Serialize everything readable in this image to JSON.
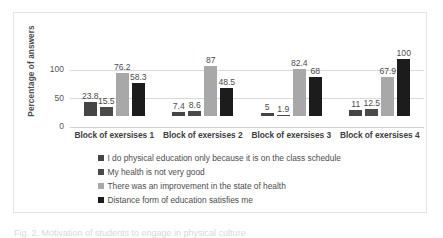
{
  "figure": {
    "caption_partial": "Fig. 2.  Motivation of students to engage in physical culture"
  },
  "chart_data": {
    "type": "bar",
    "title": "",
    "xlabel": "",
    "ylabel": "Percentage of answers",
    "ylim": [
      0,
      100
    ],
    "yticks": [
      "0",
      "50",
      "100"
    ],
    "grid": true,
    "legend_position": "bottom",
    "categories": [
      "Block of exersises 1",
      "Block of exersises 2",
      "Block of exersises 3",
      "Block of exersises 4"
    ],
    "series": [
      {
        "name": "I do physical education only because it is on the class schedule",
        "color": "#454545",
        "values": [
          23.8,
          7.4,
          5,
          11
        ],
        "labels": [
          "23.8",
          "7.4",
          "5",
          "11"
        ]
      },
      {
        "name": "My health is not very good",
        "color": "#4a4a4a",
        "values": [
          15.5,
          8.6,
          1.9,
          12.5
        ],
        "labels": [
          "15.5",
          "8.6",
          "1.9",
          "12.5"
        ]
      },
      {
        "name": "There was an improvement in the state of health",
        "color": "#a8a8a8",
        "values": [
          76.2,
          87,
          82.4,
          67.9
        ],
        "labels": [
          "76.2",
          "87",
          "82.4",
          "67.9"
        ]
      },
      {
        "name": "Distance form of education satisfies me",
        "color": "#1c1c1c",
        "values": [
          58.3,
          48.5,
          68,
          100
        ],
        "labels": [
          "58.3",
          "48.5",
          "68",
          "100"
        ]
      }
    ]
  }
}
